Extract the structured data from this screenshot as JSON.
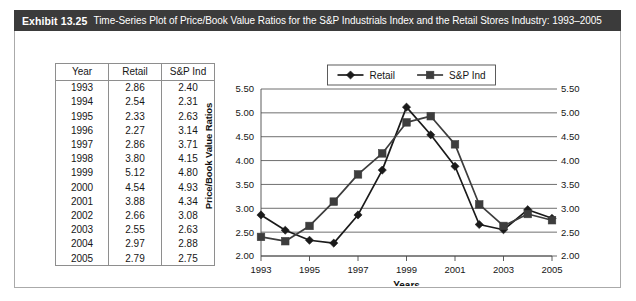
{
  "exhibit": {
    "number": "Exhibit 13.25",
    "caption": "Time-Series Plot of Price/Book Value Ratios for the S&P Industrials Index and the Retail Stores Industry: 1993–2005"
  },
  "table": {
    "headers": [
      "Year",
      "Retail",
      "S&P Ind"
    ],
    "rows": [
      [
        "1993",
        "2.86",
        "2.40"
      ],
      [
        "1994",
        "2.54",
        "2.31"
      ],
      [
        "1995",
        "2.33",
        "2.63"
      ],
      [
        "1996",
        "2.27",
        "3.14"
      ],
      [
        "1997",
        "2.86",
        "3.71"
      ],
      [
        "1998",
        "3.80",
        "4.15"
      ],
      [
        "1999",
        "5.12",
        "4.80"
      ],
      [
        "2000",
        "4.54",
        "4.93"
      ],
      [
        "2001",
        "3.88",
        "4.34"
      ],
      [
        "2002",
        "2.66",
        "3.08"
      ],
      [
        "2003",
        "2.55",
        "2.63"
      ],
      [
        "2004",
        "2.97",
        "2.88"
      ],
      [
        "2005",
        "2.79",
        "2.75"
      ]
    ]
  },
  "chart_data": {
    "type": "line",
    "title": "",
    "xlabel": "Years",
    "ylabel": "Price/Book Value Ratios",
    "x": [
      1993,
      1994,
      1995,
      1996,
      1997,
      1998,
      1999,
      2000,
      2001,
      2002,
      2003,
      2004,
      2005
    ],
    "xtick_labels": [
      "1993",
      "1995",
      "1997",
      "1999",
      "2001",
      "2003",
      "2005"
    ],
    "xticks": [
      1993,
      1995,
      1997,
      1999,
      2001,
      2003,
      2005
    ],
    "ylim": [
      2.0,
      5.5
    ],
    "yticks": [
      2.0,
      2.5,
      3.0,
      3.5,
      4.0,
      4.5,
      5.0,
      5.5
    ],
    "ytick_labels": [
      "2.00",
      "2.50",
      "3.00",
      "3.50",
      "4.00",
      "4.50",
      "5.00",
      "5.50"
    ],
    "right_axis": true,
    "right_ytick_labels": [
      "2.00",
      "2.50",
      "3.00",
      "3.50",
      "4.00",
      "4.50",
      "5.00",
      "5.50"
    ],
    "grid": "horizontal",
    "legend_position": "top-center",
    "series": [
      {
        "name": "Retail",
        "marker": "diamond",
        "color": "#1a1a1a",
        "values": [
          2.86,
          2.54,
          2.33,
          2.27,
          2.86,
          3.8,
          5.12,
          4.54,
          3.88,
          2.66,
          2.55,
          2.97,
          2.79
        ]
      },
      {
        "name": "S&P Ind",
        "marker": "square",
        "color": "#3d3d3d",
        "values": [
          2.4,
          2.31,
          2.63,
          3.14,
          3.71,
          4.15,
          4.8,
          4.93,
          4.34,
          3.08,
          2.63,
          2.88,
          2.75
        ]
      }
    ]
  }
}
